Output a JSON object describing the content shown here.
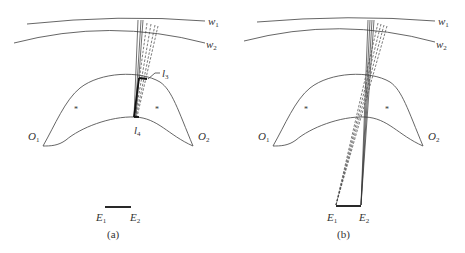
{
  "figure": {
    "panels": [
      {
        "id": "a",
        "caption": "(a)",
        "wavefront_labels": {
          "w1": "w",
          "w1_sub": "1",
          "w2": "w",
          "w2_sub": "2"
        },
        "lens_labels": {
          "O1": "O",
          "O1_sub": "1",
          "O2": "O",
          "O2_sub": "2"
        },
        "surface_labels": {
          "l3": "l",
          "l3_sub": "3",
          "l4": "l",
          "l4_sub": "4"
        },
        "eyebox_labels": {
          "E1": "E",
          "E1_sub": "1",
          "E2": "E",
          "E2_sub": "2"
        },
        "marker": "*"
      },
      {
        "id": "b",
        "caption": "(b)",
        "wavefront_labels": {
          "w1": "w",
          "w1_sub": "1",
          "w2": "w",
          "w2_sub": "2"
        },
        "lens_labels": {
          "O1": "O",
          "O1_sub": "1",
          "O2": "O",
          "O2_sub": "2"
        },
        "eyebox_labels": {
          "E1": "E",
          "E1_sub": "1",
          "E2": "E",
          "E2_sub": "2"
        },
        "marker": "*"
      }
    ],
    "colors": {
      "line": "#555555",
      "ray": "#333333",
      "bold": "#111111",
      "background": "#ffffff"
    }
  }
}
